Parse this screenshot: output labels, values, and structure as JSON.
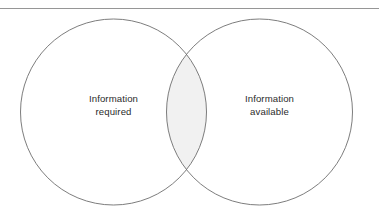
{
  "figure": {
    "background_color": "#ffffff",
    "width": 379,
    "height": 218
  },
  "top_rule": {
    "name": "horizontal-divider-rule",
    "color": "#8a8a8a",
    "y": 8.5,
    "x_start": 0,
    "x_end": 379,
    "thickness": 0.9
  },
  "sets": {
    "left": {
      "label_line_1": "Information",
      "label_line_2": "required",
      "cx": 113.5,
      "cy": 112,
      "r": 93.0,
      "fill": "#ffffff",
      "stroke": "#6e6e6e"
    },
    "right": {
      "label_line_1": "Information",
      "label_line_2": "available",
      "cx": 259.5,
      "cy": 112,
      "r": 93.0,
      "fill": "#ffffff",
      "stroke": "#6e6e6e"
    }
  },
  "intersection": {
    "name": "overlap-region",
    "fill": "#f1f1f1",
    "stroke": "none",
    "top_crossing_x": 186.5,
    "top_crossing_y": 54.5,
    "bottom_crossing_x": 186.5,
    "bottom_crossing_y": 169.5
  },
  "chart_data": {
    "type": "venn",
    "title": "",
    "xlabel": "",
    "ylabel": "",
    "categories": [
      "Information required",
      "Information available"
    ],
    "series": [
      {
        "name": "Information required",
        "label_lines": [
          "Information",
          "required"
        ],
        "center_x": 113.5,
        "center_y": 112,
        "radius": 93.0
      },
      {
        "name": "Information available",
        "label_lines": [
          "Information",
          "available"
        ],
        "center_x": 259.5,
        "center_y": 112,
        "radius": 93.0
      }
    ],
    "overlap": {
      "name": "Information required AND available",
      "shaded": true,
      "shade_color": "#f1f1f1",
      "label": ""
    },
    "legend_position": "none",
    "grid": false
  }
}
